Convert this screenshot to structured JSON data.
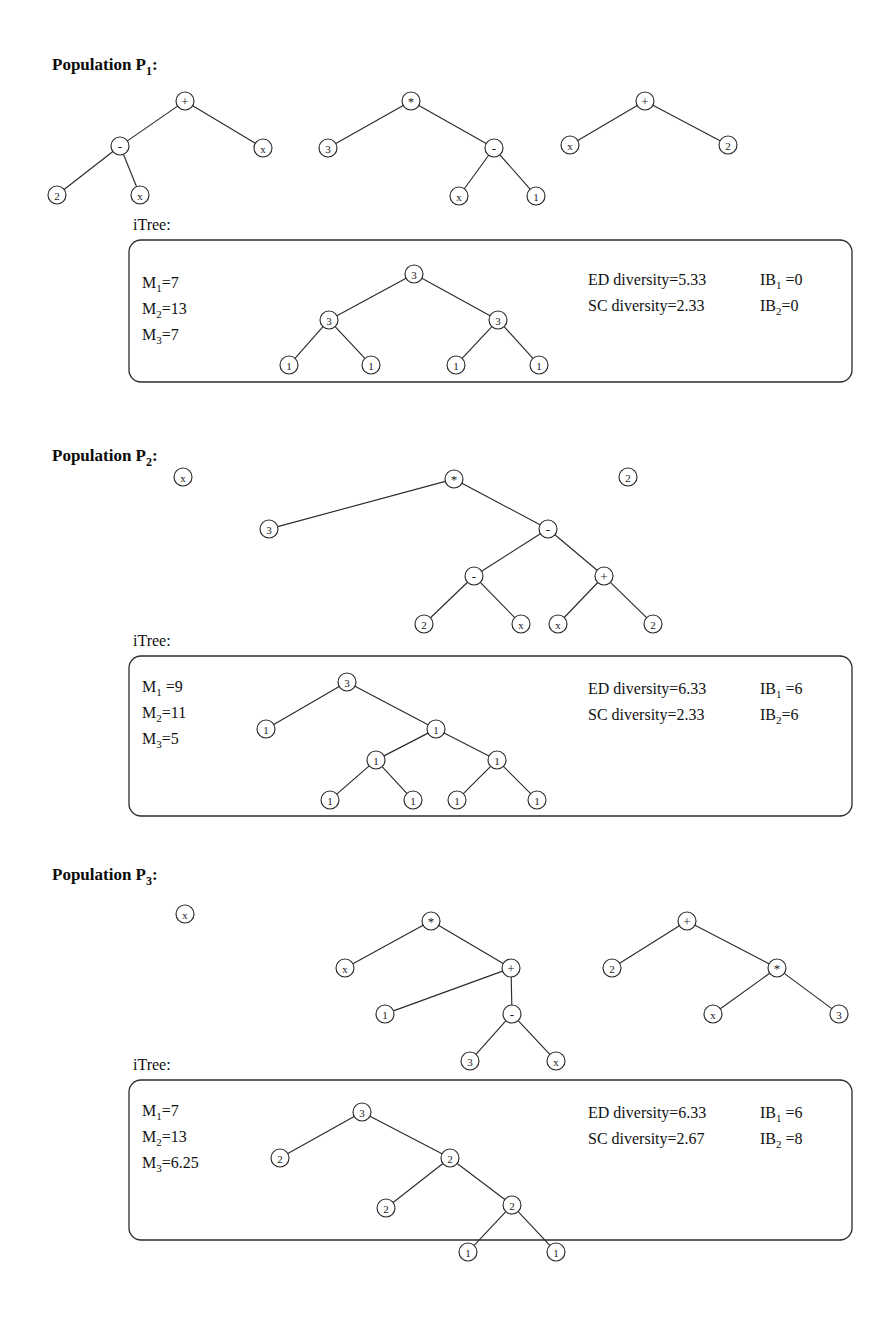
{
  "figure": {
    "node_radius": 9,
    "colors": {
      "ink": "#2b2b2b",
      "text": "#111111",
      "node_fill": "#ffffff",
      "background": "#ffffff"
    },
    "itree_caption": "iTree:"
  },
  "sections": [
    {
      "id": "p1",
      "heading_prefix": "Population P",
      "heading_sub": "1",
      "heading_suffix": ":",
      "heading_pos": {
        "x": 52,
        "y": 70
      },
      "itree_label_pos": {
        "x": 133,
        "y": 230
      },
      "box": {
        "x": 129,
        "y": 240,
        "width": 723,
        "height": 142,
        "radius": 12
      },
      "programs": [
        {
          "name": "program-1",
          "nodes": [
            {
              "id": "a",
              "label": "+",
              "kind": "op",
              "x": 185,
              "y": 101
            },
            {
              "id": "b",
              "label": "-",
              "kind": "op",
              "x": 120,
              "y": 146
            },
            {
              "id": "c",
              "label": "x",
              "kind": "terminal",
              "x": 263,
              "y": 148
            },
            {
              "id": "d",
              "label": "2",
              "kind": "terminal",
              "x": 57,
              "y": 195
            },
            {
              "id": "e",
              "label": "x",
              "kind": "terminal",
              "x": 140,
              "y": 195
            }
          ],
          "edges": [
            [
              "a",
              "b"
            ],
            [
              "a",
              "c"
            ],
            [
              "b",
              "d"
            ],
            [
              "b",
              "e"
            ]
          ]
        },
        {
          "name": "program-2",
          "nodes": [
            {
              "id": "a",
              "label": "*",
              "kind": "op",
              "x": 411,
              "y": 101
            },
            {
              "id": "b",
              "label": "3",
              "kind": "terminal",
              "x": 328,
              "y": 148
            },
            {
              "id": "c",
              "label": "-",
              "kind": "op",
              "x": 494,
              "y": 148
            },
            {
              "id": "d",
              "label": "x",
              "kind": "terminal",
              "x": 459,
              "y": 196
            },
            {
              "id": "e",
              "label": "1",
              "kind": "terminal",
              "x": 536,
              "y": 196
            }
          ],
          "edges": [
            [
              "a",
              "b"
            ],
            [
              "a",
              "c"
            ],
            [
              "c",
              "d"
            ],
            [
              "c",
              "e"
            ]
          ]
        },
        {
          "name": "program-3",
          "nodes": [
            {
              "id": "a",
              "label": "+",
              "kind": "op",
              "x": 645,
              "y": 101
            },
            {
              "id": "b",
              "label": "x",
              "kind": "terminal",
              "x": 570,
              "y": 145
            },
            {
              "id": "c",
              "label": "2",
              "kind": "terminal",
              "x": 728,
              "y": 145
            }
          ],
          "edges": [
            [
              "a",
              "b"
            ],
            [
              "a",
              "c"
            ]
          ]
        }
      ],
      "metrics_left": [
        {
          "name": "metric-m1",
          "prefix": "M",
          "sub": "1",
          "suffix": "=7",
          "x": 142,
          "y": 288
        },
        {
          "name": "metric-m2",
          "prefix": "M",
          "sub": "2",
          "suffix": "=13",
          "x": 142,
          "y": 314
        },
        {
          "name": "metric-m3",
          "prefix": "M",
          "sub": "3",
          "suffix": "=7",
          "x": 142,
          "y": 340
        }
      ],
      "metrics_right": [
        {
          "name": "metric-ed-diversity",
          "prefix": "ED diversity=5.33",
          "sub": "",
          "suffix": "",
          "x": 588,
          "y": 285
        },
        {
          "name": "metric-sc-diversity",
          "prefix": "SC diversity=2.33",
          "sub": "",
          "suffix": "",
          "x": 588,
          "y": 311
        },
        {
          "name": "metric-ib1",
          "prefix": "IB",
          "sub": "1",
          "suffix": " =0",
          "x": 760,
          "y": 285
        },
        {
          "name": "metric-ib2",
          "prefix": "IB",
          "sub": "2",
          "suffix": "=0",
          "x": 760,
          "y": 311
        }
      ],
      "itree": {
        "name": "itree-1",
        "nodes": [
          {
            "id": "r",
            "label": "3",
            "kind": "terminal",
            "x": 414,
            "y": 274
          },
          {
            "id": "l",
            "label": "3",
            "kind": "terminal",
            "x": 329,
            "y": 320
          },
          {
            "id": "rr",
            "label": "3",
            "kind": "terminal",
            "x": 498,
            "y": 320
          },
          {
            "id": "ll",
            "label": "1",
            "kind": "terminal",
            "x": 289,
            "y": 365
          },
          {
            "id": "lr",
            "label": "1",
            "kind": "terminal",
            "x": 371,
            "y": 365
          },
          {
            "id": "rl",
            "label": "1",
            "kind": "terminal",
            "x": 456,
            "y": 365
          },
          {
            "id": "rrr",
            "label": "1",
            "kind": "terminal",
            "x": 539,
            "y": 365
          }
        ],
        "edges": [
          [
            "r",
            "l"
          ],
          [
            "r",
            "rr"
          ],
          [
            "l",
            "ll"
          ],
          [
            "l",
            "lr"
          ],
          [
            "rr",
            "rl"
          ],
          [
            "rr",
            "rrr"
          ]
        ]
      }
    },
    {
      "id": "p2",
      "heading_prefix": "Population P",
      "heading_sub": "2",
      "heading_suffix": ":",
      "heading_pos": {
        "x": 52,
        "y": 461
      },
      "itree_label_pos": {
        "x": 133,
        "y": 646
      },
      "box": {
        "x": 129,
        "y": 656,
        "width": 723,
        "height": 160,
        "radius": 12
      },
      "programs": [
        {
          "name": "program-1",
          "nodes": [
            {
              "id": "a",
              "label": "x",
              "kind": "terminal",
              "x": 183,
              "y": 477
            }
          ],
          "edges": []
        },
        {
          "name": "program-2",
          "nodes": [
            {
              "id": "a",
              "label": "*",
              "kind": "op",
              "x": 454,
              "y": 479
            },
            {
              "id": "b",
              "label": "3",
              "kind": "terminal",
              "x": 269,
              "y": 529
            },
            {
              "id": "c",
              "label": "-",
              "kind": "op",
              "x": 548,
              "y": 529
            },
            {
              "id": "d",
              "label": "-",
              "kind": "op",
              "x": 474,
              "y": 576
            },
            {
              "id": "e",
              "label": "+",
              "kind": "op",
              "x": 604,
              "y": 576
            },
            {
              "id": "f",
              "label": "2",
              "kind": "terminal",
              "x": 424,
              "y": 624
            },
            {
              "id": "g",
              "label": "x",
              "kind": "terminal",
              "x": 521,
              "y": 624
            },
            {
              "id": "h",
              "label": "x",
              "kind": "terminal",
              "x": 558,
              "y": 624
            },
            {
              "id": "i",
              "label": "2",
              "kind": "terminal",
              "x": 653,
              "y": 624
            }
          ],
          "edges": [
            [
              "a",
              "b"
            ],
            [
              "a",
              "c"
            ],
            [
              "c",
              "d"
            ],
            [
              "c",
              "e"
            ],
            [
              "d",
              "f"
            ],
            [
              "d",
              "g"
            ],
            [
              "e",
              "h"
            ],
            [
              "e",
              "i"
            ]
          ]
        },
        {
          "name": "program-3",
          "nodes": [
            {
              "id": "a",
              "label": "2",
              "kind": "terminal",
              "x": 628,
              "y": 477
            }
          ],
          "edges": []
        }
      ],
      "metrics_left": [
        {
          "name": "metric-m1",
          "prefix": "M",
          "sub": "1",
          "suffix": " =9",
          "x": 142,
          "y": 692
        },
        {
          "name": "metric-m2",
          "prefix": "M",
          "sub": "2",
          "suffix": "=11",
          "x": 142,
          "y": 718
        },
        {
          "name": "metric-m3",
          "prefix": "M",
          "sub": "3",
          "suffix": "=5",
          "x": 142,
          "y": 744
        }
      ],
      "metrics_right": [
        {
          "name": "metric-ed-diversity",
          "prefix": "ED diversity=6.33",
          "sub": "",
          "suffix": "",
          "x": 588,
          "y": 694
        },
        {
          "name": "metric-sc-diversity",
          "prefix": "SC diversity=2.33",
          "sub": "",
          "suffix": "",
          "x": 588,
          "y": 720
        },
        {
          "name": "metric-ib1",
          "prefix": "IB",
          "sub": "1",
          "suffix": " =6",
          "x": 760,
          "y": 694
        },
        {
          "name": "metric-ib2",
          "prefix": "IB",
          "sub": "2",
          "suffix": "=6",
          "x": 760,
          "y": 720
        }
      ],
      "itree": {
        "name": "itree-2",
        "nodes": [
          {
            "id": "r",
            "label": "3",
            "kind": "terminal",
            "x": 347,
            "y": 682
          },
          {
            "id": "l",
            "label": "1",
            "kind": "terminal",
            "x": 266,
            "y": 729
          },
          {
            "id": "rr",
            "label": "1",
            "kind": "terminal",
            "x": 436,
            "y": 729
          },
          {
            "id": "m1",
            "label": "1",
            "kind": "terminal",
            "x": 376,
            "y": 760
          },
          {
            "id": "m2",
            "label": "1",
            "kind": "terminal",
            "x": 497,
            "y": 760
          },
          {
            "id": "c1",
            "label": "1",
            "kind": "terminal",
            "x": 330,
            "y": 800
          },
          {
            "id": "c2",
            "label": "1",
            "kind": "terminal",
            "x": 413,
            "y": 800
          },
          {
            "id": "c3",
            "label": "1",
            "kind": "terminal",
            "x": 457,
            "y": 800
          },
          {
            "id": "c4",
            "label": "1",
            "kind": "terminal",
            "x": 537,
            "y": 800
          }
        ],
        "edges": [
          [
            "r",
            "l"
          ],
          [
            "r",
            "rr"
          ],
          [
            "rr",
            "m1"
          ],
          [
            "rr",
            "m2"
          ],
          [
            "m1",
            "c1"
          ],
          [
            "m1",
            "c2"
          ],
          [
            "m2",
            "c3"
          ],
          [
            "m2",
            "c4"
          ]
        ]
      }
    },
    {
      "id": "p3",
      "heading_prefix": "Population P",
      "heading_sub": "3",
      "heading_suffix": ":",
      "heading_pos": {
        "x": 52,
        "y": 880
      },
      "itree_label_pos": {
        "x": 133,
        "y": 1070
      },
      "box": {
        "x": 129,
        "y": 1080,
        "width": 723,
        "height": 160,
        "radius": 12
      },
      "programs": [
        {
          "name": "program-1",
          "nodes": [
            {
              "id": "a",
              "label": "x",
              "kind": "terminal",
              "x": 185,
              "y": 914
            }
          ],
          "edges": []
        },
        {
          "name": "program-2",
          "nodes": [
            {
              "id": "a",
              "label": "*",
              "kind": "op",
              "x": 431,
              "y": 921
            },
            {
              "id": "b",
              "label": "x",
              "kind": "terminal",
              "x": 345,
              "y": 968
            },
            {
              "id": "c",
              "label": "+",
              "kind": "op",
              "x": 511,
              "y": 968
            },
            {
              "id": "d",
              "label": "1",
              "kind": "terminal",
              "x": 385,
              "y": 1014
            },
            {
              "id": "e",
              "label": "-",
              "kind": "op",
              "x": 512,
              "y": 1014
            },
            {
              "id": "f",
              "label": "3",
              "kind": "terminal",
              "x": 470,
              "y": 1061
            },
            {
              "id": "g",
              "label": "x",
              "kind": "terminal",
              "x": 556,
              "y": 1061
            }
          ],
          "edges": [
            [
              "a",
              "b"
            ],
            [
              "a",
              "c"
            ],
            [
              "c",
              "d"
            ],
            [
              "c",
              "e"
            ],
            [
              "e",
              "f"
            ],
            [
              "e",
              "g"
            ]
          ]
        },
        {
          "name": "program-3",
          "nodes": [
            {
              "id": "a",
              "label": "+",
              "kind": "op",
              "x": 687,
              "y": 921
            },
            {
              "id": "b",
              "label": "2",
              "kind": "terminal",
              "x": 612,
              "y": 968
            },
            {
              "id": "c",
              "label": "*",
              "kind": "op",
              "x": 777,
              "y": 968
            },
            {
              "id": "d",
              "label": "x",
              "kind": "terminal",
              "x": 713,
              "y": 1014
            },
            {
              "id": "e",
              "label": "3",
              "kind": "terminal",
              "x": 839,
              "y": 1014
            }
          ],
          "edges": [
            [
              "a",
              "b"
            ],
            [
              "a",
              "c"
            ],
            [
              "c",
              "d"
            ],
            [
              "c",
              "e"
            ]
          ]
        }
      ],
      "metrics_left": [
        {
          "name": "metric-m1",
          "prefix": "M",
          "sub": "1",
          "suffix": "=7",
          "x": 142,
          "y": 1116
        },
        {
          "name": "metric-m2",
          "prefix": "M",
          "sub": "2",
          "suffix": "=13",
          "x": 142,
          "y": 1142
        },
        {
          "name": "metric-m3",
          "prefix": "M",
          "sub": "3",
          "suffix": "=6.25",
          "x": 142,
          "y": 1168
        }
      ],
      "metrics_right": [
        {
          "name": "metric-ed-diversity",
          "prefix": "ED diversity=6.33",
          "sub": "",
          "suffix": "",
          "x": 588,
          "y": 1118
        },
        {
          "name": "metric-sc-diversity",
          "prefix": "SC diversity=2.67",
          "sub": "",
          "suffix": "",
          "x": 588,
          "y": 1144
        },
        {
          "name": "metric-ib1",
          "prefix": "IB",
          "sub": "1",
          "suffix": " =6",
          "x": 760,
          "y": 1118
        },
        {
          "name": "metric-ib2",
          "prefix": "IB",
          "sub": "2",
          "suffix": " =8",
          "x": 760,
          "y": 1144
        }
      ],
      "itree": {
        "name": "itree-3",
        "nodes": [
          {
            "id": "r",
            "label": "3",
            "kind": "terminal",
            "x": 362,
            "y": 1112
          },
          {
            "id": "l",
            "label": "2",
            "kind": "terminal",
            "x": 280,
            "y": 1158
          },
          {
            "id": "rr",
            "label": "2",
            "kind": "terminal",
            "x": 450,
            "y": 1158
          },
          {
            "id": "m1",
            "label": "2",
            "kind": "terminal",
            "x": 386,
            "y": 1208
          },
          {
            "id": "m2",
            "label": "2",
            "kind": "terminal",
            "x": 512,
            "y": 1205
          },
          {
            "id": "c1",
            "label": "1",
            "kind": "terminal",
            "x": 468,
            "y": 1252
          },
          {
            "id": "c2",
            "label": "1",
            "kind": "terminal",
            "x": 556,
            "y": 1252
          }
        ],
        "edges": [
          [
            "r",
            "l"
          ],
          [
            "r",
            "rr"
          ],
          [
            "rr",
            "m1"
          ],
          [
            "rr",
            "m2"
          ],
          [
            "m2",
            "c1"
          ],
          [
            "m2",
            "c2"
          ]
        ]
      }
    }
  ]
}
